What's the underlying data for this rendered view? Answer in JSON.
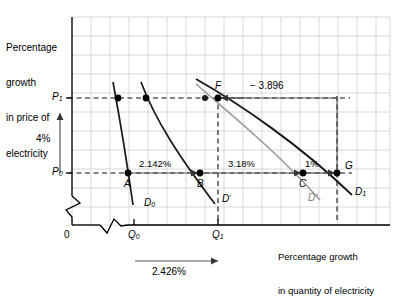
{
  "figure": {
    "axes": {
      "y_axis_title": "Percentage\ngrowth\nin price of\nelectricity",
      "y_axis_title_lines": [
        "Percentage",
        "growth",
        "in price of",
        "electricity"
      ],
      "x_axis_title_lines": [
        "Percentage growth",
        "in quantity of electricity"
      ],
      "origin_label": "0",
      "y_ticks": [
        {
          "id": "P1",
          "base": "P",
          "sub": "1",
          "value_y_px": 98
        },
        {
          "id": "P0",
          "base": "P",
          "sub": "0",
          "value_y_px": 173
        }
      ],
      "x_ticks": [
        {
          "id": "Q0",
          "base": "Q",
          "sub": "0",
          "value_x_px": 134
        },
        {
          "id": "Q1",
          "base": "Q",
          "sub": "1",
          "value_x_px": 218
        }
      ],
      "y_break": true,
      "x_break": true,
      "grid": true,
      "grid_spacing_px": 19
    },
    "measures": {
      "price_change": "4%",
      "quantity_change": "2.426%",
      "segment_a_to_b": "2.142%",
      "segment_b_to_c": "3.18%",
      "segment_c_to_g": "1%",
      "elasticity_f_to_g": "− 3.896"
    },
    "points": [
      {
        "label": "A",
        "x": 128,
        "y": 173
      },
      {
        "label": "B",
        "x": 200,
        "y": 173
      },
      {
        "label": "C",
        "x": 303,
        "y": 173
      },
      {
        "label": "G",
        "x": 337,
        "y": 173
      },
      {
        "label": "F",
        "x": 218,
        "y": 98
      }
    ],
    "curves": [
      {
        "id": "D0",
        "base": "D",
        "sub": "0",
        "sup": "",
        "label": "D₀",
        "color": "#1a1a1a"
      },
      {
        "id": "Dp",
        "base": "D",
        "sub": "",
        "sup": "′",
        "label": "D′",
        "color": "#1a1a1a"
      },
      {
        "id": "Dpp",
        "base": "D",
        "sub": "",
        "sup": "″",
        "label": "D″",
        "color": "#9a9a9a"
      },
      {
        "id": "D1",
        "base": "D",
        "sub": "1",
        "sup": "",
        "label": "D₁",
        "color": "#1a1a1a"
      }
    ],
    "colors": {
      "grid": "#c8cdd4",
      "axis": "#000000",
      "curve_dark": "#1a1a1a",
      "curve_grey": "#9a9a9a",
      "dashed": "#111111",
      "arrow_line": "#555555"
    }
  }
}
